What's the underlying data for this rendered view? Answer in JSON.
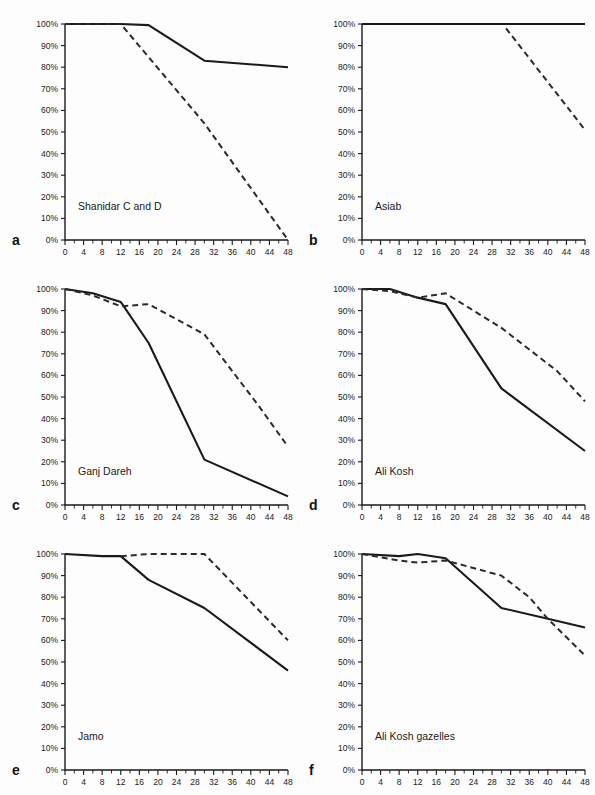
{
  "figure": {
    "background": "#fdfdfd",
    "ink": "#1a1a1a",
    "panel_count": 6
  },
  "axes": {
    "x_label": "",
    "y_label": "",
    "x_ticks": [
      "0",
      "4",
      "8",
      "12",
      "16",
      "20",
      "24",
      "28",
      "32",
      "36",
      "40",
      "44",
      "48"
    ],
    "y_ticks": [
      "0%",
      "10%",
      "20%",
      "30%",
      "40%",
      "50%",
      "60%",
      "70%",
      "80%",
      "90%",
      "100%"
    ],
    "x_min": 0,
    "x_max": 48,
    "y_min": 0,
    "y_max": 100,
    "x_minor_step": 2,
    "grid": false
  },
  "panels": [
    {
      "letter": "a",
      "title": "Shanidar C and D"
    },
    {
      "letter": "b",
      "title": "Asiab"
    },
    {
      "letter": "c",
      "title": "Ganj Dareh"
    },
    {
      "letter": "d",
      "title": "Ali Kosh"
    },
    {
      "letter": "e",
      "title": "Jamo"
    },
    {
      "letter": "f",
      "title": "Ali Kosh gazelles"
    }
  ],
  "chart_data": [
    {
      "type": "line",
      "panel": "a",
      "title": "Shanidar C and D",
      "xlabel": "",
      "ylabel": "",
      "xlim": [
        0,
        48
      ],
      "ylim": [
        0,
        100
      ],
      "grid": false,
      "legend": "none",
      "series": [
        {
          "name": "solid",
          "style": "solid",
          "x": [
            0,
            6,
            12,
            18,
            30,
            48
          ],
          "values": [
            100,
            100,
            100,
            99.5,
            83,
            80
          ]
        },
        {
          "name": "dashed",
          "style": "dashed",
          "x": [
            0,
            6,
            12,
            30,
            48
          ],
          "values": [
            100,
            100,
            100,
            54,
            0
          ]
        }
      ]
    },
    {
      "type": "line",
      "panel": "b",
      "title": "Asiab",
      "xlabel": "",
      "ylabel": "",
      "xlim": [
        0,
        48
      ],
      "ylim": [
        0,
        100
      ],
      "grid": false,
      "legend": "none",
      "series": [
        {
          "name": "solid",
          "style": "solid",
          "x": [
            0,
            48
          ],
          "values": [
            100,
            100
          ]
        },
        {
          "name": "dashed",
          "style": "dashed",
          "x": [
            31,
            48
          ],
          "values": [
            98,
            51
          ]
        }
      ]
    },
    {
      "type": "line",
      "panel": "c",
      "title": "Ganj Dareh",
      "xlabel": "",
      "ylabel": "",
      "xlim": [
        0,
        48
      ],
      "ylim": [
        0,
        100
      ],
      "grid": false,
      "legend": "none",
      "series": [
        {
          "name": "solid",
          "style": "solid",
          "x": [
            0,
            6,
            12,
            18,
            30,
            48
          ],
          "values": [
            100,
            98,
            94,
            75,
            21,
            4
          ]
        },
        {
          "name": "dashed",
          "style": "dashed",
          "x": [
            0,
            6,
            12,
            18,
            30,
            42,
            48
          ],
          "values": [
            100,
            97,
            92,
            93,
            79,
            45,
            27
          ]
        }
      ]
    },
    {
      "type": "line",
      "panel": "d",
      "title": "Ali Kosh",
      "xlabel": "",
      "ylabel": "",
      "xlim": [
        0,
        48
      ],
      "ylim": [
        0,
        100
      ],
      "grid": false,
      "legend": "none",
      "series": [
        {
          "name": "solid",
          "style": "solid",
          "x": [
            0,
            6,
            12,
            18,
            30,
            48
          ],
          "values": [
            100,
            100,
            96,
            93,
            54,
            25
          ]
        },
        {
          "name": "dashed",
          "style": "dashed",
          "x": [
            0,
            6,
            12,
            18,
            30,
            42,
            48
          ],
          "values": [
            100,
            99,
            96,
            98,
            82,
            62,
            48
          ]
        }
      ]
    },
    {
      "type": "line",
      "panel": "e",
      "title": "Jamo",
      "xlabel": "",
      "ylabel": "",
      "xlim": [
        0,
        48
      ],
      "ylim": [
        0,
        100
      ],
      "grid": false,
      "legend": "none",
      "series": [
        {
          "name": "solid",
          "style": "solid",
          "x": [
            0,
            8,
            12,
            18,
            30,
            48
          ],
          "values": [
            100,
            99,
            99,
            88,
            75,
            46
          ]
        },
        {
          "name": "dashed",
          "style": "dashed",
          "x": [
            12,
            18,
            30,
            48
          ],
          "values": [
            99,
            100,
            100,
            60
          ]
        }
      ]
    },
    {
      "type": "line",
      "panel": "f",
      "title": "Ali Kosh gazelles",
      "xlabel": "",
      "ylabel": "",
      "xlim": [
        0,
        48
      ],
      "ylim": [
        0,
        100
      ],
      "grid": false,
      "legend": "none",
      "series": [
        {
          "name": "solid",
          "style": "solid",
          "x": [
            0,
            8,
            12,
            18,
            30,
            40,
            48
          ],
          "values": [
            100,
            99,
            100,
            98,
            75,
            70,
            66
          ]
        },
        {
          "name": "dashed",
          "style": "dashed",
          "x": [
            0,
            8,
            12,
            18,
            30,
            36,
            40,
            48
          ],
          "values": [
            100,
            97,
            96,
            97,
            90,
            80,
            70,
            53
          ]
        }
      ]
    }
  ]
}
